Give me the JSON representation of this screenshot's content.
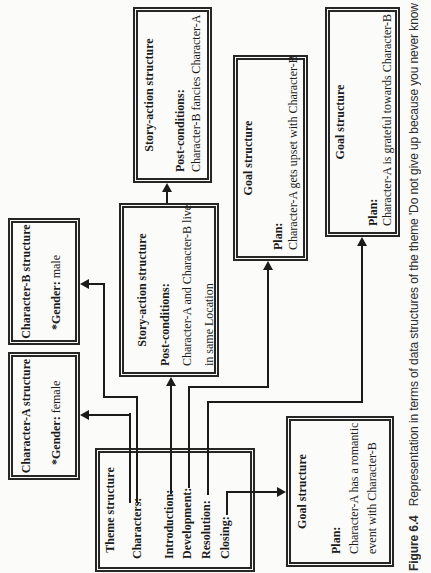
{
  "figure": {
    "caption_label": "Figure 6.4",
    "caption_text": "Representation in terms of data structures of the theme 'Do not give up because you never know"
  },
  "colors": {
    "ink": "#1b1b1b",
    "paper": "#fbfbf9"
  },
  "boxes": {
    "theme": {
      "title": "Theme structure",
      "labels": [
        "Characters:",
        "Introduction:",
        "Development:",
        "Resolution:",
        "Closing:"
      ]
    },
    "char_a": {
      "title": "Character-A structure",
      "field_label": "*Gender:",
      "field_value": "female"
    },
    "char_b": {
      "title": "Character-B structure",
      "field_label": "*Gender:",
      "field_value": "male"
    },
    "story_action_1": {
      "title": "Story-action structure",
      "section_label": "Post-conditions:",
      "lines": [
        "Character-A and Character-B live",
        "in same Location"
      ]
    },
    "story_action_2": {
      "title": "Story-action structure",
      "section_label": "Post-conditions:",
      "lines": [
        "Character-B fancies Character-A"
      ]
    },
    "goal_upset": {
      "title": "Goal structure",
      "section_label": "Plan:",
      "lines": [
        "Character-A gets upset with Character-B"
      ]
    },
    "goal_grateful": {
      "title": "Goal structure",
      "section_label": "Plan:",
      "lines": [
        "Character-A is grateful towards Character-B"
      ]
    },
    "goal_romantic": {
      "title": "Goal structure",
      "section_label": "Plan:",
      "lines": [
        "Character-A has a romantic",
        "event with Character-B"
      ]
    }
  },
  "connections": [
    {
      "from": "theme.Characters",
      "to": "char_a"
    },
    {
      "from": "theme.Characters",
      "to": "char_b"
    },
    {
      "from": "theme.Introduction",
      "to": "story_action_1"
    },
    {
      "from": "story_action_1",
      "to": "story_action_2"
    },
    {
      "from": "theme.Development",
      "to": "goal_upset"
    },
    {
      "from": "theme.Resolution",
      "to": "goal_grateful"
    },
    {
      "from": "theme.Closing",
      "to": "goal_romantic"
    }
  ]
}
